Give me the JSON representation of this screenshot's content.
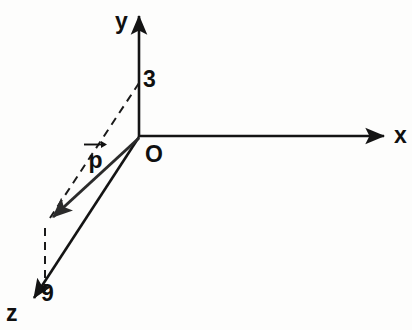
{
  "figure": {
    "type": "3d-axis-vector-diagram",
    "background_color": "#fdfdfc",
    "stroke_color": "#141414",
    "vector_color": "#2b2b2b"
  },
  "axes": {
    "x": {
      "label": "x",
      "label_x": 396,
      "label_y": 125,
      "origin": [
        139,
        137
      ],
      "tip": [
        390,
        136
      ]
    },
    "y": {
      "label": "y",
      "label_x": 115,
      "label_y": 10,
      "origin": [
        139,
        137
      ],
      "tip": [
        139,
        10
      ]
    },
    "z": {
      "label": "z",
      "label_x": 6,
      "label_y": 303,
      "origin": [
        139,
        137
      ],
      "tip": [
        29,
        304
      ]
    }
  },
  "origin": {
    "label": "O",
    "label_x": 145,
    "label_y": 142
  },
  "marks": [
    {
      "name": "y-intercept",
      "label": "3",
      "label_x": 142,
      "label_y": 68,
      "point": [
        139,
        83
      ]
    },
    {
      "name": "z-intercept",
      "label": "9",
      "label_x": 41,
      "label_y": 283,
      "point": [
        45,
        290
      ]
    }
  ],
  "vector": {
    "label": "p",
    "label_x": 84,
    "label_y": 142,
    "overbar_icon": "right-arrow-overbar",
    "start": [
      139,
      137
    ],
    "end": [
      47,
      221
    ]
  },
  "construction_lines": [
    {
      "name": "projection-from-y",
      "from": [
        139,
        83
      ],
      "to": [
        47,
        221
      ],
      "style": "dashed"
    },
    {
      "name": "projection-to-z",
      "from": [
        45,
        228
      ],
      "to": [
        45,
        291
      ],
      "style": "dashed"
    }
  ]
}
